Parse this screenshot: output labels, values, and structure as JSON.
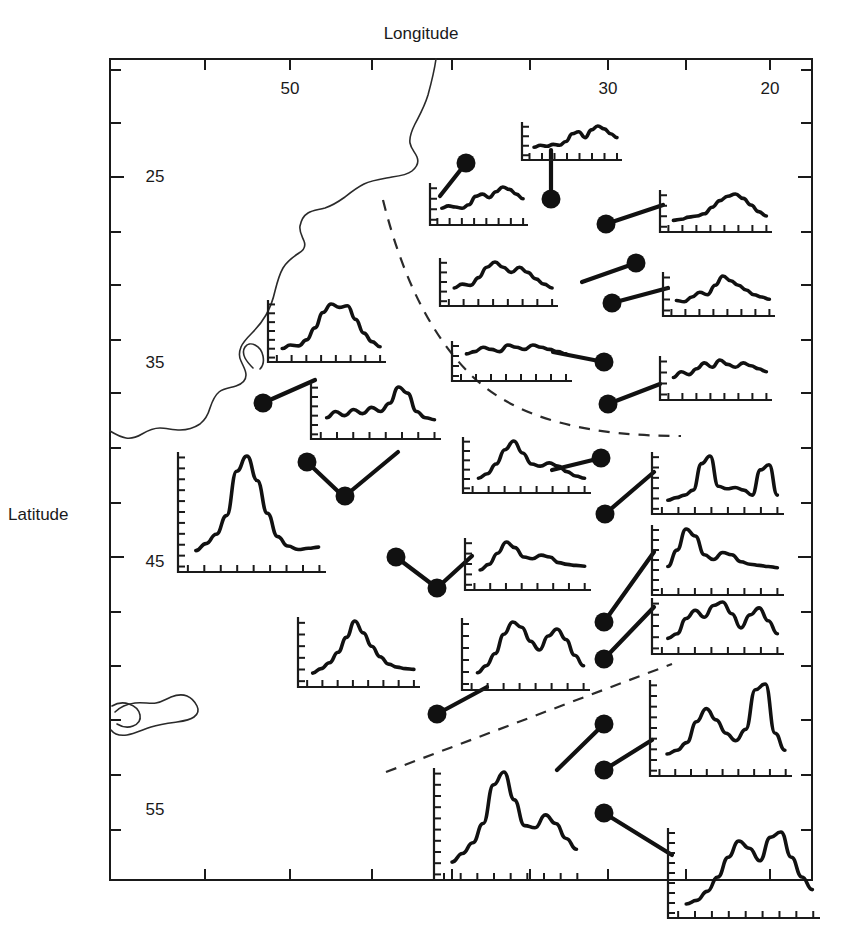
{
  "figure": {
    "kind": "map-with-inset-timeseries",
    "background": "#ffffff",
    "ink": "#1a1a1a",
    "width": 842,
    "height": 950
  },
  "axes": {
    "x_title": "Longitude",
    "y_title": "Latitude",
    "x_tick_labels": [
      "50",
      "30",
      "20"
    ],
    "y_tick_labels": [
      "25",
      "35",
      "45",
      "55"
    ],
    "x_label_positions": [
      290,
      608,
      770
    ],
    "y_label_positions": [
      177,
      363,
      562,
      810
    ],
    "x_ticks": [
      205,
      290,
      372,
      452,
      530,
      608,
      686,
      770
    ],
    "y_ticks": [
      70,
      123,
      177,
      232,
      285,
      340,
      393,
      448,
      503,
      557,
      612,
      666,
      720,
      775,
      830
    ],
    "frame": {
      "left": 110,
      "right": 812,
      "top": 59,
      "bottom": 880
    },
    "x_direction": "decreasing-left-to-right",
    "y_direction": "increasing-top-to-bottom"
  },
  "chart_data": {
    "type": "line",
    "title": "Longitude",
    "xlabel": "Longitude",
    "ylabel": "Latitude",
    "grid": false,
    "legend": "none",
    "xlim": [
      56,
      15
    ],
    "ylim": [
      21,
      58
    ],
    "series": [
      {
        "name": "inset-1",
        "site_lon": 33.5,
        "site_lat": 24.2,
        "values": [
          0.1,
          0.12,
          0.11,
          0.1,
          0.13,
          0.2,
          0.22,
          0.19,
          0.24,
          0.28,
          0.26,
          0.22,
          0.18
        ]
      },
      {
        "name": "inset-2",
        "site_lon": 36.0,
        "site_lat": 25.9,
        "values": [
          0.08,
          0.1,
          0.09,
          0.11,
          0.1,
          0.14,
          0.22,
          0.24,
          0.18,
          0.26,
          0.3,
          0.27,
          0.22,
          0.18
        ]
      },
      {
        "name": "inset-3",
        "site_lon": 29.5,
        "site_lat": 26.6,
        "values": [
          0.06,
          0.07,
          0.09,
          0.1,
          0.12,
          0.18,
          0.24,
          0.28,
          0.3,
          0.26,
          0.2,
          0.14,
          0.1
        ]
      },
      {
        "name": "inset-4",
        "site_lon": 28.6,
        "site_lat": 28.4,
        "values": [
          0.1,
          0.13,
          0.12,
          0.18,
          0.26,
          0.3,
          0.26,
          0.22,
          0.26,
          0.22,
          0.17,
          0.13,
          0.1
        ]
      },
      {
        "name": "inset-5",
        "site_lon": 28.9,
        "site_lat": 30.6,
        "values": [
          0.09,
          0.08,
          0.12,
          0.16,
          0.14,
          0.22,
          0.3,
          0.26,
          0.22,
          0.18,
          0.14,
          0.12,
          0.1
        ]
      },
      {
        "name": "inset-6",
        "site_lon": 29.2,
        "site_lat": 32.8,
        "values": [
          0.1,
          0.11,
          0.13,
          0.12,
          0.11,
          0.14,
          0.13,
          0.12,
          0.14,
          0.13,
          0.12,
          0.11,
          0.1
        ]
      },
      {
        "name": "inset-7",
        "site_lon": 28.8,
        "site_lat": 34.6,
        "values": [
          0.12,
          0.16,
          0.14,
          0.18,
          0.22,
          0.19,
          0.24,
          0.21,
          0.19,
          0.22,
          0.2,
          0.18,
          0.16
        ]
      },
      {
        "name": "inset-8",
        "site_lon": 46.8,
        "site_lat": 31.4,
        "values": [
          0.1,
          0.14,
          0.13,
          0.2,
          0.34,
          0.52,
          0.62,
          0.58,
          0.6,
          0.44,
          0.28,
          0.18,
          0.12
        ]
      },
      {
        "name": "inset-9",
        "site_lon": 46.1,
        "site_lat": 37.5,
        "values": [
          0.16,
          0.22,
          0.18,
          0.24,
          0.2,
          0.26,
          0.22,
          0.3,
          0.46,
          0.4,
          0.22,
          0.16,
          0.14
        ]
      },
      {
        "name": "inset-10",
        "site_lon": 43.0,
        "site_lat": 38.8,
        "values": [
          0.14,
          0.2,
          0.28,
          0.44,
          0.82,
          0.95,
          0.74,
          0.46,
          0.26,
          0.18,
          0.15,
          0.16,
          0.17
        ]
      },
      {
        "name": "inset-11",
        "site_lon": 35.2,
        "site_lat": 38.2,
        "values": [
          0.12,
          0.18,
          0.26,
          0.4,
          0.6,
          0.82,
          0.66,
          0.48,
          0.34,
          0.24,
          0.2,
          0.18,
          0.17
        ]
      },
      {
        "name": "inset-12",
        "site_lon": 27.9,
        "site_lat": 38.6,
        "values": [
          0.18,
          0.26,
          0.44,
          0.7,
          0.86,
          0.64,
          0.44,
          0.4,
          0.46,
          0.4,
          0.3,
          0.22,
          0.18
        ]
      },
      {
        "name": "inset-13",
        "site_lon": 27.8,
        "site_lat": 41.2,
        "values": [
          0.14,
          0.18,
          0.22,
          0.3,
          0.72,
          0.84,
          0.36,
          0.32,
          0.34,
          0.3,
          0.22,
          0.62,
          0.7,
          0.22
        ]
      },
      {
        "name": "inset-14",
        "site_lon": 35.4,
        "site_lat": 43.0,
        "values": [
          0.16,
          0.22,
          0.34,
          0.46,
          0.4,
          0.3,
          0.28,
          0.32,
          0.3,
          0.24,
          0.22,
          0.21,
          0.2
        ]
      },
      {
        "name": "inset-15",
        "site_lon": 27.6,
        "site_lat": 44.1,
        "values": [
          0.2,
          0.34,
          0.52,
          0.46,
          0.3,
          0.26,
          0.32,
          0.3,
          0.24,
          0.22,
          0.21,
          0.2,
          0.19
        ]
      },
      {
        "name": "inset-16",
        "site_lon": 42.0,
        "site_lat": 46.4,
        "values": [
          0.18,
          0.26,
          0.52,
          0.66,
          0.54,
          0.74,
          0.8,
          0.6,
          0.36,
          0.58,
          0.7,
          0.48,
          0.26
        ]
      },
      {
        "name": "inset-17",
        "site_lon": 35.4,
        "site_lat": 48.0,
        "values": [
          0.14,
          0.22,
          0.36,
          0.58,
          0.72,
          0.66,
          0.5,
          0.4,
          0.56,
          0.64,
          0.52,
          0.34,
          0.22
        ]
      },
      {
        "name": "inset-18",
        "site_lon": 28.4,
        "site_lat": 49.4,
        "values": [
          0.12,
          0.2,
          0.3,
          0.48,
          0.84,
          0.96,
          0.7,
          0.46,
          0.44,
          0.56,
          0.48,
          0.34,
          0.24
        ]
      },
      {
        "name": "inset-19",
        "site_lon": 27.3,
        "site_lat": 52.0,
        "values": [
          0.18,
          0.22,
          0.3,
          0.52,
          0.66,
          0.54,
          0.4,
          0.32,
          0.44,
          0.86,
          0.92,
          0.4,
          0.22
        ]
      },
      {
        "name": "inset-20",
        "site_lon": 30.8,
        "site_lat": 53.2,
        "values": [
          0.1,
          0.14,
          0.24,
          0.4,
          0.62,
          0.8,
          0.72,
          0.58,
          0.84,
          0.9,
          0.62,
          0.4,
          0.26
        ]
      },
      {
        "name": "inset-21",
        "site_lon": 29.8,
        "site_lat": 55.4,
        "values": [
          0.14,
          0.2,
          0.34,
          0.3,
          0.44,
          0.4,
          0.52,
          0.7,
          0.64,
          0.98,
          0.96,
          0.5,
          0.24
        ]
      },
      {
        "name": "inset-22",
        "site_lon": 26.6,
        "site_lat": 56.6,
        "values": [
          0.12,
          0.18,
          0.28,
          0.24,
          0.38,
          0.34,
          0.46,
          0.6,
          0.88,
          0.72,
          0.96,
          0.58,
          0.2
        ]
      }
    ]
  },
  "annotations": {
    "dashed_arc_label": "dashed boundary arc",
    "dashed_line_label": "dashed boundary line",
    "coastline_label": "coastline"
  }
}
